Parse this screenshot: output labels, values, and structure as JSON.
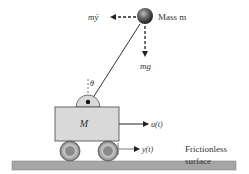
{
  "diagram": {
    "mass_label": "Mass m",
    "inertial_force_label": "mÿ",
    "gravity_label": "mg",
    "angle_label": "θ",
    "cart_label": "M",
    "input_label": "u(t)",
    "position_label": "y(t)",
    "surface_label_line1": "Frictionless",
    "surface_label_line2": "surface"
  },
  "colors": {
    "cart_fill": "#d9d9d9",
    "cart_stroke": "#555555",
    "ground_fill": "#a6a6a6",
    "wheel_outer": "#7a7a7a",
    "wheel_inner": "#a0a0a0",
    "ball_dark": "#2a2a2a",
    "ball_light": "#9a9a9a",
    "line": "#222222"
  }
}
